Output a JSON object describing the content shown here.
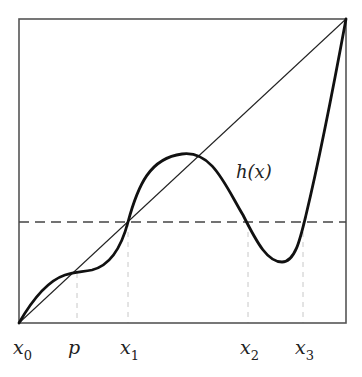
{
  "diagram": {
    "curve_label": "h(x)",
    "x_labels": [
      {
        "base": "x",
        "sub": "0"
      },
      {
        "base": "p",
        "sub": ""
      },
      {
        "base": "x",
        "sub": "1"
      },
      {
        "base": "x",
        "sub": "2"
      },
      {
        "base": "x",
        "sub": "3"
      }
    ],
    "elements": [
      "unit square frame",
      "diagonal line y=x",
      "curve h(x)",
      "horizontal dashed level line",
      "vertical dashed guide lines at p, x1, x2, x3"
    ],
    "colors": {
      "curve": "#111111",
      "frame": "#444444",
      "guides": "#bbbbbb"
    }
  }
}
